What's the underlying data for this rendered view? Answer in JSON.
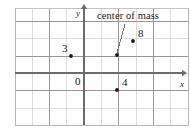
{
  "figure": {
    "width": 191,
    "height": 130,
    "background": "#ffffff"
  },
  "annotation": {
    "text": "center of mass",
    "color": "#1a1a1a",
    "leader_line": {
      "from_x": 125,
      "from_y": 24,
      "to_x": 117,
      "to_y": 53
    }
  },
  "axes": {
    "x_label": "x",
    "y_label": "y",
    "origin_label": "0",
    "axis_color": "#6b6b6b",
    "x_axis_y": 73,
    "y_axis_x": 84,
    "x_axis_end": 182,
    "y_axis_top": 9
  },
  "grid": {
    "color_light": "#cfcfcf",
    "color_dark": "#8c8c8c",
    "border_color": "#bdbdbd",
    "cell_size": 17.3,
    "left": 15,
    "top": 8,
    "right": 188,
    "bottom": 125,
    "v_lines": [
      15,
      32.3,
      49.6,
      66.9,
      84.2,
      101.5,
      118.8,
      136.1,
      153.4,
      170.7,
      188
    ],
    "h_lines": [
      8,
      21.5,
      38.8,
      56.1,
      73.4,
      90.7,
      108,
      125
    ]
  },
  "points": [
    {
      "name": "point-3",
      "label": "3",
      "dot_x": 71,
      "dot_y": 56,
      "label_x": 62,
      "label_y": 43,
      "color": "#1a1a1a"
    },
    {
      "name": "point-8",
      "label": "8",
      "dot_x": 133,
      "dot_y": 41,
      "label_x": 138,
      "label_y": 28,
      "color": "#1a1a1a"
    },
    {
      "name": "point-4",
      "label": "4",
      "dot_x": 117,
      "dot_y": 90,
      "label_x": 122,
      "label_y": 77,
      "color": "#1a1a1a"
    },
    {
      "name": "point-center-of-mass",
      "label": "",
      "dot_x": 117,
      "dot_y": 55,
      "label_x": 0,
      "label_y": 0,
      "color": "#1a1a1a"
    }
  ],
  "chart_data": {
    "type": "scatter",
    "title": "center of mass",
    "xlabel": "x",
    "ylabel": "y",
    "grid": true,
    "legend": "none",
    "annotations": [
      "center of mass"
    ],
    "origin": "0",
    "series": [
      {
        "name": "masses",
        "points": [
          {
            "label": "3",
            "px": [
              71,
              56
            ]
          },
          {
            "label": "8",
            "px": [
              133,
              41
            ]
          },
          {
            "label": "4",
            "px": [
              117,
              90
            ]
          }
        ]
      },
      {
        "name": "center-of-mass",
        "points": [
          {
            "label": "center of mass",
            "px": [
              117,
              55
            ]
          }
        ]
      }
    ]
  }
}
